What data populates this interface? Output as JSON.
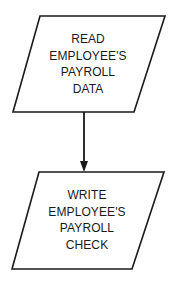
{
  "diagram": {
    "type": "flowchart",
    "colors": {
      "stroke": "#1a1a1a",
      "fill": "#ffffff",
      "text": "#1a1a1a",
      "background": "#ffffff"
    },
    "nodes": [
      {
        "id": "read-data",
        "shape": "parallelogram",
        "role": "input/output",
        "lines": [
          "READ",
          "EMPLOYEE'S",
          "PAYROLL",
          "DATA"
        ]
      },
      {
        "id": "write-check",
        "shape": "parallelogram",
        "role": "input/output",
        "lines": [
          "WRITE",
          "EMPLOYEE'S",
          "PAYROLL",
          "CHECK"
        ]
      }
    ],
    "edges": [
      {
        "from": "read-data",
        "to": "write-check",
        "style": "solid-arrow"
      }
    ]
  }
}
